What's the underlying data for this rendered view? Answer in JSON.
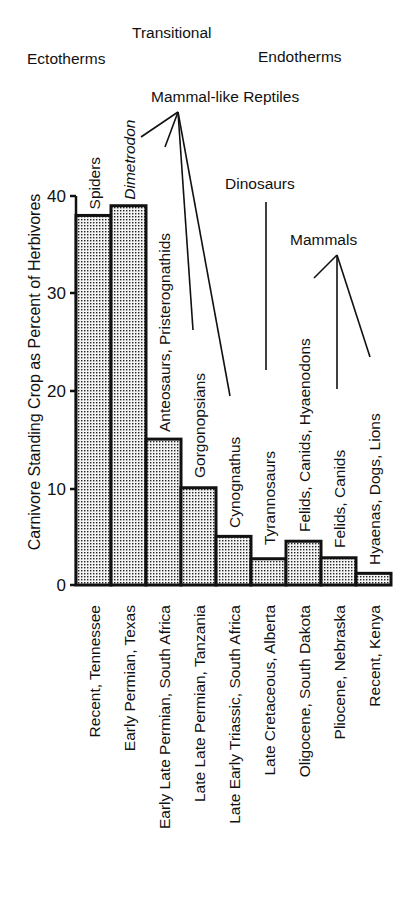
{
  "chart_data": {
    "type": "bar",
    "title": "",
    "xlabel": "",
    "ylabel": "Carnivore Standing Crop as Percent of Herbivores",
    "ylim": [
      0,
      40
    ],
    "yticks": [
      0,
      10,
      20,
      30,
      40
    ],
    "grid": false,
    "legend": null,
    "categories": [
      "Recent, Tennessee",
      "Early Permian, Texas",
      "Early Late Permian, South Africa",
      "Late Late Permian, Tanzania",
      "Late Early Triassic, South Africa",
      "Late Cretaceous, Alberta",
      "Oligocene, South Dakota",
      "Pliocene, Nebraska",
      "Recent, Kenya"
    ],
    "values": [
      38,
      39,
      15,
      10,
      5,
      2.7,
      4.5,
      2.8,
      1.2
    ],
    "bar_annotations": [
      {
        "text": "Spiders",
        "italic": false
      },
      {
        "text": "Dimetrodon",
        "italic": true
      },
      {
        "text": "Anteosaurs, Pristerognathids",
        "italic": false
      },
      {
        "text": "Gorgonopsians",
        "italic": false
      },
      {
        "text": "Cynognathus",
        "italic": false
      },
      {
        "text": "Tyrannosaurs",
        "italic": false
      },
      {
        "text": "Felids, Canids, Hyaenodons",
        "italic": false
      },
      {
        "text": "Felids, Canids",
        "italic": false
      },
      {
        "text": "Hyaenas, Dogs, Lions",
        "italic": false
      }
    ],
    "group_labels": {
      "ectotherms": "Ectotherms",
      "transitional": "Transitional",
      "endotherms": "Endotherms",
      "mammal_like_reptiles": "Mammal-like Reptiles",
      "dinosaurs": "Dinosaurs",
      "mammals": "Mammals"
    }
  }
}
